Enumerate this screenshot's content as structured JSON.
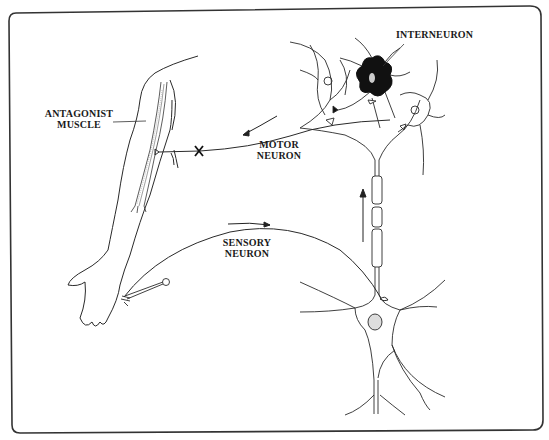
{
  "diagram": {
    "type": "reflex-arc",
    "labels": {
      "interneuron": "INTERNEURON",
      "antagonist_line1": "ANTAGONIST",
      "antagonist_line2": "MUSCLE",
      "motor_line1": "MOTOR",
      "motor_line2": "NEURON",
      "sensory_line1": "SENSORY",
      "sensory_line2": "NEURON"
    },
    "markers": {
      "inhibition": "X"
    },
    "colors": {
      "stroke": "#2a2a2a",
      "frame": "#333333",
      "interneuron_fill": "#111111",
      "background": "#ffffff"
    }
  }
}
